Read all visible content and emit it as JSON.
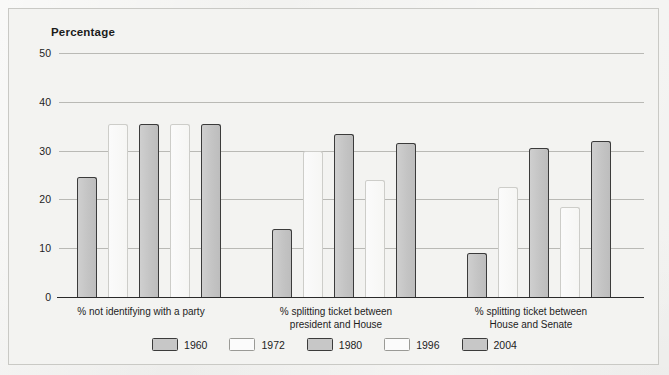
{
  "chart_data": {
    "type": "bar",
    "title": "Percentage",
    "xlabel": "",
    "ylabel": "Percentage",
    "ylim": [
      0,
      50
    ],
    "ytick_labels": [
      "0",
      "10",
      "20",
      "30",
      "40",
      "50"
    ],
    "ytick_values": [
      0,
      10,
      20,
      30,
      40,
      50
    ],
    "grid": true,
    "legend_position": "bottom",
    "categories": [
      "% not identifying with a party",
      "% splitting ticket between president and House",
      "% splitting ticket between House and Senate"
    ],
    "category_lines": [
      [
        "% not identifying with a party"
      ],
      [
        "% splitting ticket between",
        "president and House"
      ],
      [
        "% splitting ticket between",
        "House and Senate"
      ]
    ],
    "series": [
      {
        "name": "1960",
        "style": "dark",
        "color": "#c7c7c7",
        "values": [
          24.5,
          14.0,
          9.0
        ]
      },
      {
        "name": "1972",
        "style": "light",
        "color": "#fbfbfb",
        "values": [
          35.5,
          30.0,
          22.5
        ]
      },
      {
        "name": "1980",
        "style": "dark",
        "color": "#c7c7c7",
        "values": [
          35.5,
          33.5,
          30.5
        ]
      },
      {
        "name": "1996",
        "style": "light",
        "color": "#fbfbfb",
        "values": [
          35.5,
          24.0,
          18.5
        ]
      },
      {
        "name": "2004",
        "style": "dark",
        "color": "#c7c7c7",
        "values": [
          35.5,
          31.5,
          32.0
        ]
      }
    ]
  },
  "legend": {
    "entries": [
      {
        "label": "1960",
        "style": "dark"
      },
      {
        "label": "1972",
        "style": "light"
      },
      {
        "label": "1980",
        "style": "dark"
      },
      {
        "label": "1996",
        "style": "light"
      },
      {
        "label": "2004",
        "style": "dark"
      }
    ]
  },
  "colors": {
    "background": "#f3f3f1",
    "frame_border": "#c9c9c5",
    "gridline": "#b9b9b5",
    "axis": "#2a2a2a",
    "bar_dark_fill": "#c7c7c7",
    "bar_dark_border": "#3b3b3b",
    "bar_light_fill": "#fbfbfb",
    "bar_light_border": "#cdcdc9",
    "text": "#1d1d1d"
  }
}
